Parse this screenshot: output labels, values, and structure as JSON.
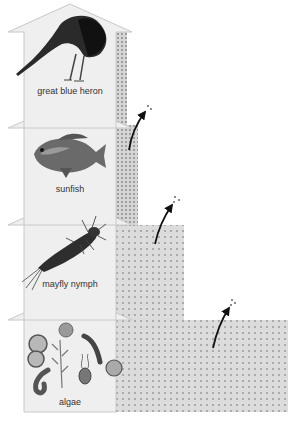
{
  "diagram": {
    "type": "energy pyramid / food chain",
    "levels": [
      {
        "label": "great blue heron",
        "organism_icon": "heron-icon",
        "level": 4
      },
      {
        "label": "sunfish",
        "organism_icon": "fish-icon",
        "level": 3
      },
      {
        "label": "mayfly nymph",
        "organism_icon": "mayfly-nymph-icon",
        "level": 2
      },
      {
        "label": "algae",
        "organism_icon": "algae-icon",
        "level": 1
      }
    ],
    "energy_lost_arrows": 3,
    "colors": {
      "arrow_fill": "#efefef",
      "arrow_stroke": "#c8c8c8",
      "energy_box": "#dcdcdc",
      "dots": "#9a9a9a",
      "heat_arrow": "#111111"
    }
  }
}
